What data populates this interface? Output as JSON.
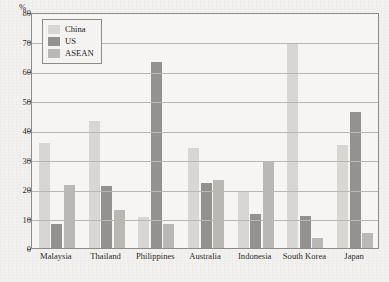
{
  "chart_data": {
    "type": "bar",
    "title": "",
    "subtitle": "",
    "xlabel": "",
    "ylabel": "%",
    "ylim": [
      0,
      80
    ],
    "ytick_step": 10,
    "yticks": [
      "0",
      "10",
      "20",
      "30",
      "40",
      "50",
      "60",
      "70",
      "80"
    ],
    "grid": "horizontal",
    "legend_position": "top-left-inside",
    "categories": [
      "Malaysia",
      "Thailand",
      "Philippines",
      "Australia",
      "Indonesia",
      "South Korea",
      "Japan"
    ],
    "series": [
      {
        "name": "China",
        "color": "#d7d6d3",
        "values": [
          35.5,
          43,
          10.5,
          34,
          19,
          69,
          35
        ]
      },
      {
        "name": "US",
        "color": "#949290",
        "values": [
          8,
          21,
          63,
          22,
          11.5,
          11,
          46
        ]
      },
      {
        "name": "ASEAN",
        "color": "#bab8b5",
        "values": [
          21.5,
          13,
          8,
          23,
          29,
          3.5,
          5
        ]
      }
    ]
  },
  "colors": {
    "background": "#f2f1ef",
    "plot_background": "#f6f5f3",
    "axis": "#8d8b88",
    "gridline": "#b9b7b4",
    "text": "#2e2c2a"
  }
}
